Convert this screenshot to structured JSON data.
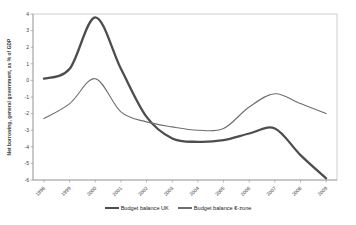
{
  "chart_data": {
    "type": "line",
    "title": "",
    "ylabel": "Net borrowing, general government, as % of GDP",
    "xlabel": "",
    "categories": [
      "1998",
      "1999",
      "2000",
      "2001",
      "2002",
      "2003",
      "2004",
      "2005",
      "2006",
      "2007",
      "2008",
      "2009"
    ],
    "y_ticks": [
      4,
      3,
      2,
      1,
      0,
      -1,
      -2,
      -3,
      -4,
      -5,
      -6
    ],
    "ylim": [
      -6,
      4
    ],
    "grid": false,
    "legend_position": "bottom-center",
    "series": [
      {
        "name": "Budget balance UK",
        "color": "#4d4d4d",
        "stroke_width": 2.3,
        "values": [
          0.1,
          0.7,
          3.8,
          0.7,
          -2.2,
          -3.5,
          -3.7,
          -3.6,
          -3.2,
          -2.9,
          -4.5,
          -5.9
        ]
      },
      {
        "name": "Budget balance €-zone",
        "color": "#6e6e6e",
        "stroke_width": 1.1,
        "values": [
          -2.3,
          -1.4,
          0.1,
          -1.9,
          -2.5,
          -2.8,
          -3.0,
          -2.9,
          -1.6,
          -0.8,
          -1.4,
          -2.0
        ]
      }
    ],
    "colors": {
      "frame": "#b9b9b9",
      "axis": "#8f8f8f",
      "tick_text": "#3a3a3a",
      "background": "#ffffff"
    }
  }
}
